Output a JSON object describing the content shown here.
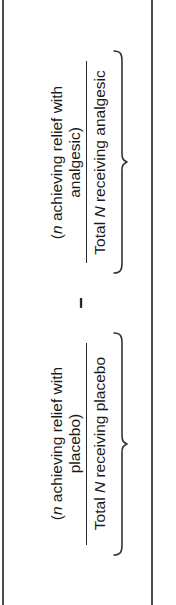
{
  "figure": {
    "orientation": "rotated-90-ccw",
    "colors": {
      "text": "#1a1a1a",
      "rule": "#4a4a4a",
      "brace": "#333333",
      "background": "#ffffff"
    }
  },
  "rules": {
    "left_label": "left-page-rule",
    "right_label": "right-page-rule"
  },
  "formula": {
    "operator": "–",
    "terms": [
      {
        "id": "analgesic",
        "numerator_prefix": "(",
        "numerator_italic": "n",
        "numerator": "(n achieving relief with\nanalgesic)",
        "denominator_italic": "N",
        "denominator": "Total N receiving analgesic",
        "brace": "under-brace"
      },
      {
        "id": "placebo",
        "numerator_prefix": "(",
        "numerator_italic": "n",
        "numerator": "(n achieving relief with\nplacebo)",
        "denominator_italic": "N",
        "denominator": "Total N receiving placebo",
        "brace": "under-brace"
      }
    ]
  },
  "text_parts": {
    "analgesic": {
      "num_open": "(",
      "num_n": "n",
      "num_rest": " achieving relief with",
      "num_line2": "analgesic)",
      "den_pre": "Total ",
      "den_N": "N",
      "den_post": " receiving analgesic"
    },
    "placebo": {
      "num_open": "(",
      "num_n": "n",
      "num_rest": " achieving relief with",
      "num_line2": "placebo)",
      "den_pre": "Total ",
      "den_N": "N",
      "den_post": " receiving placebo"
    }
  }
}
